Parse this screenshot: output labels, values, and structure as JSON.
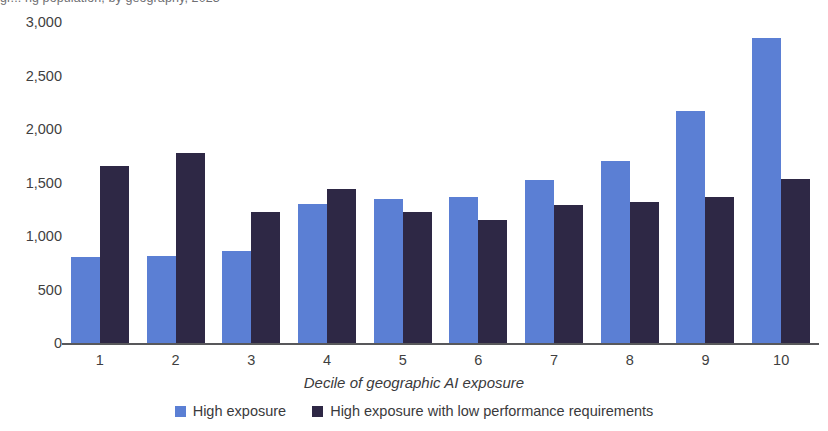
{
  "figure": {
    "clipped_top_title": "gr... ng population, by geography, 2023",
    "colors": {
      "series_high_exposure": "#5B7FD4",
      "series_low_perf_req": "#2E2845",
      "axis": "#58585B",
      "text": "#3A3A3C"
    }
  },
  "chart_data": {
    "type": "bar",
    "title": "",
    "xlabel": "Decile of geographic AI exposure",
    "ylabel": "",
    "categories": [
      "1",
      "2",
      "3",
      "4",
      "5",
      "6",
      "7",
      "8",
      "9",
      "10"
    ],
    "series": [
      {
        "name": "High exposure",
        "color": "#5B7FD4",
        "values": [
          800,
          810,
          860,
          1300,
          1350,
          1360,
          1520,
          1700,
          2170,
          2850
        ]
      },
      {
        "name": "High exposure with low performance requirements",
        "color": "#2E2845",
        "values": [
          1650,
          1780,
          1220,
          1440,
          1220,
          1150,
          1290,
          1320,
          1360,
          1530
        ]
      }
    ],
    "ylim": [
      0,
      3000
    ],
    "ytick_values": [
      0,
      500,
      1000,
      1500,
      2000,
      2500,
      3000
    ],
    "ytick_labels": [
      "0",
      "500",
      "1,000",
      "1,500",
      "2,000",
      "2,500",
      "3,000"
    ],
    "grid": false,
    "legend_position": "bottom"
  }
}
